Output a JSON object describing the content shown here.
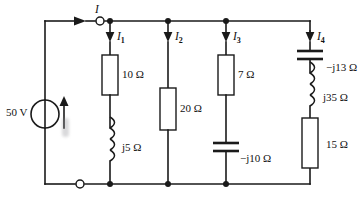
{
  "figure": {
    "name": "ac-parallel-circuit-diagram",
    "source": {
      "label": "50 V",
      "symbol": "voltage-source-circle",
      "current_arrow": "up"
    },
    "total_current": {
      "label": "I",
      "direction": "right"
    },
    "branches": [
      {
        "current_label": "I",
        "current_sub": "1",
        "components": [
          {
            "type": "resistor",
            "value": "10 Ω"
          },
          {
            "type": "inductor",
            "value": "j5 Ω"
          }
        ]
      },
      {
        "current_label": "I",
        "current_sub": "2",
        "components": [
          {
            "type": "resistor",
            "value": "20 Ω"
          }
        ]
      },
      {
        "current_label": "I",
        "current_sub": "3",
        "components": [
          {
            "type": "resistor",
            "value": "7 Ω"
          },
          {
            "type": "capacitor",
            "value": "−j10 Ω"
          }
        ]
      },
      {
        "current_label": "I",
        "current_sub": "4",
        "components": [
          {
            "type": "capacitor",
            "value": "−j13 Ω"
          },
          {
            "type": "inductor",
            "value": "j35 Ω"
          },
          {
            "type": "resistor",
            "value": "15 Ω"
          }
        ]
      }
    ],
    "terminals": [
      {
        "name": "top-open-terminal"
      },
      {
        "name": "bottom-open-terminal"
      }
    ],
    "colors": {
      "ink": "#1a1a1a",
      "background": "#ffffff"
    }
  }
}
